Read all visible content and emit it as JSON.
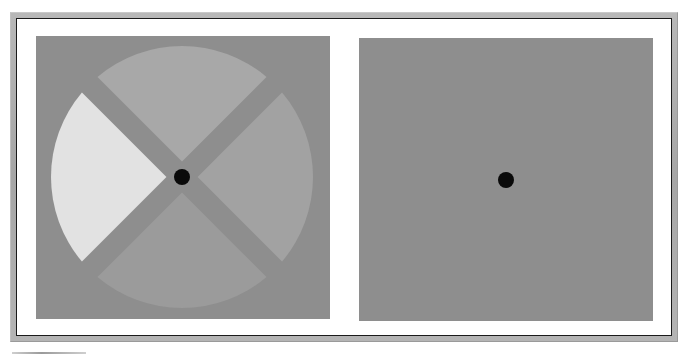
{
  "figure": {
    "colors": {
      "background_gray": "#8e8e8e",
      "sector_top": "#a8a8a8",
      "sector_right": "#a2a2a2",
      "sector_bottom": "#9b9b9b",
      "sector_left": "#e2e2e2",
      "fixation_dot": "#0a0a0a",
      "frame_border": "#1a1a1a"
    },
    "left_panel": {
      "label": "",
      "disk": {
        "center": [
          146,
          141
        ],
        "radius": 131,
        "gap_width": 22,
        "sectors": [
          {
            "name": "top",
            "start_deg": -135,
            "end_deg": -45,
            "color_key": "sector_top"
          },
          {
            "name": "right",
            "start_deg": -45,
            "end_deg": 45,
            "color_key": "sector_right"
          },
          {
            "name": "bottom",
            "start_deg": 45,
            "end_deg": 135,
            "color_key": "sector_bottom"
          },
          {
            "name": "left",
            "start_deg": 135,
            "end_deg": 225,
            "color_key": "sector_left"
          }
        ]
      },
      "fixation_dot": {
        "center": [
          146,
          141
        ],
        "radius": 8
      }
    },
    "right_panel": {
      "label": "",
      "fixation_dot": {
        "center": [
          147,
          142
        ],
        "radius": 8
      }
    }
  }
}
